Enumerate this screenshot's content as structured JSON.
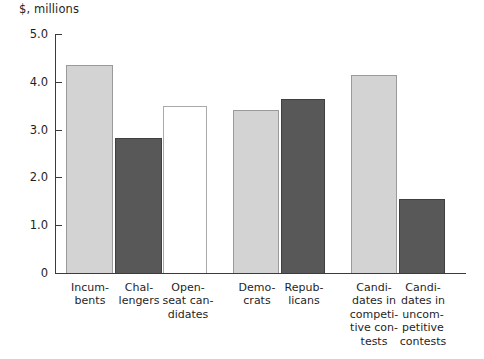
{
  "chart_data": {
    "type": "bar",
    "title": "",
    "subtitle": "",
    "ylabel": "$, millions",
    "xlabel": "",
    "ylim": [
      0,
      5.0
    ],
    "ytick_labels": [
      "5.0",
      "4.0",
      "3.0",
      "2.0",
      "1.0",
      "0"
    ],
    "ytick_values": [
      5.0,
      4.0,
      3.0,
      2.0,
      1.0,
      0
    ],
    "grid": false,
    "legend": "none",
    "categories": [
      "Incum-\nbents",
      "Chal-\nlengers",
      "Open-\nseat can-\ndidates",
      "Demo-\ncrats",
      "Repub-\nlicans",
      "Candi-\ndates in\ncompeti-\ntive con-\ntests",
      "Candi-\ndates in\nuncom-\npetitive\ncontests"
    ],
    "values": [
      4.35,
      2.82,
      3.5,
      3.42,
      3.65,
      4.15,
      1.55
    ],
    "bar_styles": [
      "light",
      "dark",
      "white",
      "light",
      "dark",
      "light",
      "dark"
    ],
    "colors": {
      "light_bar": "#d3d3d3",
      "dark_bar": "#585858",
      "white_bar": "#ffffff",
      "axis": "#3b3b3b",
      "text": "#1f1f1f"
    }
  }
}
